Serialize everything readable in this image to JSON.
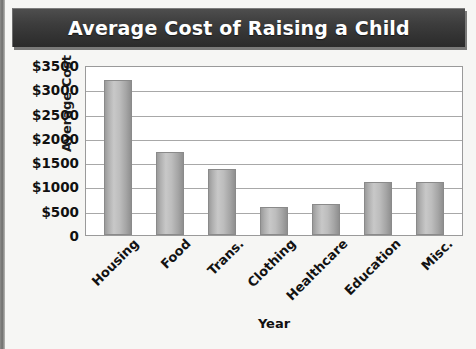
{
  "chart_data": {
    "type": "bar",
    "title": "Average Cost of Raising a Child",
    "xlabel": "Year",
    "ylabel": "Average Cost",
    "categories": [
      "Housing",
      "Food",
      "Trans.",
      "Clothing",
      "Healthcare",
      "Education",
      "Misc."
    ],
    "values": [
      3200,
      1700,
      1350,
      570,
      630,
      1100,
      1100
    ],
    "ylim": [
      0,
      3500
    ],
    "ytick_values": [
      3500,
      3000,
      2500,
      2000,
      1500,
      1000,
      500,
      0
    ],
    "ytick_labels": [
      "$3500",
      "$3000",
      "$2500",
      "$2000",
      "$1500",
      "$1000",
      "$500",
      "0"
    ],
    "grid": "horizontal",
    "legend": "none",
    "bar_color": "#b8b8b8",
    "title_bar_color": "#3a3a3a",
    "title_text_color": "#ffffff",
    "plot_background": "#ffffff",
    "page_background": "#f6f6f4"
  }
}
